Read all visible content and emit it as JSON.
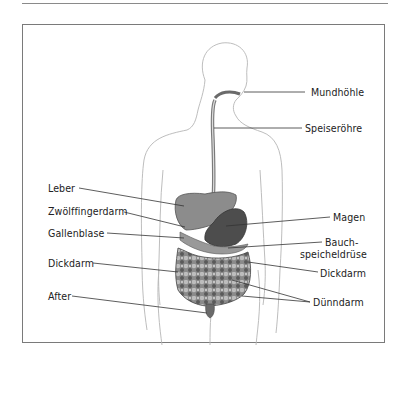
{
  "figure": {
    "labels_left": [
      {
        "id": "leber",
        "text": "Leber"
      },
      {
        "id": "zwoelffingerdarm",
        "text": "Zwölffingerdarm"
      },
      {
        "id": "gallenblase",
        "text": "Gallenblase"
      },
      {
        "id": "dickdarm_left",
        "text": "Dickdarm"
      },
      {
        "id": "after",
        "text": "After"
      }
    ],
    "labels_right": [
      {
        "id": "mundhoehle",
        "text": "Mundhöhle"
      },
      {
        "id": "speiseroehre",
        "text": "Speiseröhre"
      },
      {
        "id": "magen",
        "text": "Magen"
      },
      {
        "id": "bauch_line1",
        "text": "Bauch-"
      },
      {
        "id": "bauch_line2",
        "text": "speicheldrüse"
      },
      {
        "id": "dickdarm_right",
        "text": "Dickdarm"
      },
      {
        "id": "duenndarm",
        "text": "Dünndarm"
      }
    ],
    "colors": {
      "outline": "#b0b0b0",
      "leader": "#333333",
      "organ_dark": "#4a4a4a",
      "organ_mid": "#7d7d7d",
      "organ_light": "#a8a8a8",
      "frame": "#7a7a7a"
    }
  }
}
